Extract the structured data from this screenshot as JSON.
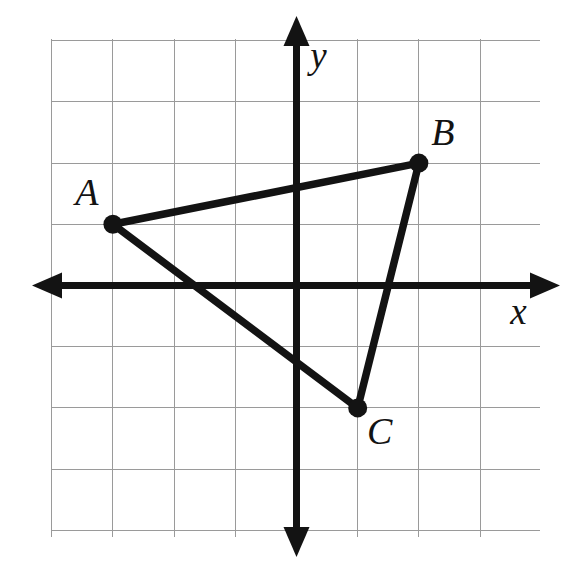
{
  "figure": {
    "background_color": "#ffffff",
    "ink_color": "#131313",
    "grid_color": "#9a9a9a"
  },
  "chart_data": {
    "type": "scatter",
    "title": "",
    "xlabel": "x",
    "ylabel": "y",
    "grid": true,
    "legend": "none",
    "xlim": [
      -4,
      4
    ],
    "ylim": [
      -4,
      4
    ],
    "x_tick_labels": [],
    "y_tick_labels": [],
    "grid_step": 1,
    "axes": {
      "x_axis_label": "x",
      "y_axis_label": "y",
      "x_axis_arrows": "both",
      "y_axis_arrows": "both"
    },
    "points": [
      {
        "name": "A",
        "label": "A",
        "x": -3,
        "y": 1
      },
      {
        "name": "B",
        "label": "B",
        "x": 2,
        "y": 2
      },
      {
        "name": "C",
        "label": "C",
        "x": 1,
        "y": -2
      }
    ],
    "segments": [
      {
        "name": "AB",
        "from": "A",
        "to": "B"
      },
      {
        "name": "BC",
        "from": "B",
        "to": "C"
      },
      {
        "name": "AC",
        "from": "A",
        "to": "C"
      }
    ],
    "shape": "triangle"
  },
  "labels": {
    "point_a": "A",
    "point_b": "B",
    "point_c": "C",
    "x_axis": "x",
    "y_axis": "y"
  },
  "geometry": {
    "origin_px": {
      "x": 296.5,
      "y": 285.5
    },
    "unit_px": 61.2,
    "grid_bounds_px": {
      "left": 52,
      "top": 39,
      "right": 540,
      "bottom": 537
    },
    "x_axis_span_px": {
      "start": 32,
      "end": 560
    },
    "y_axis_span_px": {
      "start": 16,
      "end": 557
    },
    "label_offsets_px": {
      "A": {
        "x": -26,
        "y": -28
      },
      "B": {
        "x": 24,
        "y": -27
      },
      "C": {
        "x": 22,
        "y": 27
      },
      "x": {
        "x": 222,
        "y": 30
      },
      "y": {
        "x": 22,
        "y": -226
      }
    },
    "dot_radius_px": 9.5
  }
}
